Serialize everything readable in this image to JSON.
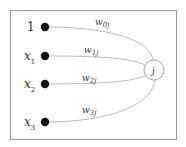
{
  "diagram": {
    "type": "perceptron-node",
    "inputs": [
      {
        "label": "1",
        "sub": "",
        "italic": false
      },
      {
        "label": "x",
        "sub": "1",
        "italic": true
      },
      {
        "label": "x",
        "sub": "2",
        "italic": true
      },
      {
        "label": "x",
        "sub": "3",
        "italic": true
      }
    ],
    "weights": [
      {
        "label": "w",
        "sub": "0j"
      },
      {
        "label": "w",
        "sub": "1j"
      },
      {
        "label": "w",
        "sub": "2j"
      },
      {
        "label": "w",
        "sub": "3j"
      }
    ],
    "node": {
      "label": "j"
    },
    "colors": {
      "frame": "#999999",
      "edge": "#bbbbbb",
      "dot": "#111111",
      "text": "#333333"
    }
  }
}
